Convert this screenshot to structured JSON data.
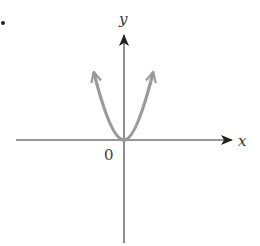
{
  "figure": {
    "bullet": "•",
    "labels": {
      "y_axis": "y",
      "x_axis": "x",
      "origin": "0"
    },
    "colors": {
      "axis": "#333333",
      "curve": "#9a9a9a",
      "text": "#333333"
    },
    "axes": {
      "origin_px": [
        124,
        140
      ],
      "x_axis_range_px": [
        16,
        232
      ],
      "y_axis_range_px": [
        35,
        243
      ]
    },
    "curve": {
      "type": "parabola",
      "equation_shape": "y = a·x², a > 0",
      "vertex_px": [
        124,
        140
      ],
      "left_end_px": [
        94,
        72
      ],
      "right_end_px": [
        153,
        72
      ],
      "arrowheads": [
        "left-end",
        "right-end"
      ]
    }
  }
}
